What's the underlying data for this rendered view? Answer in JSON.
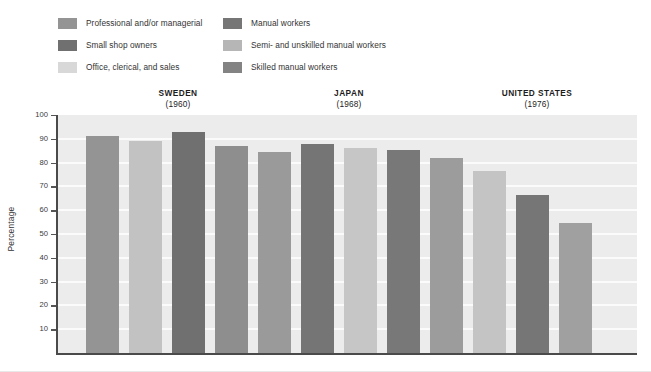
{
  "chart_data": {
    "type": "bar",
    "title": "",
    "xlabel": "",
    "ylabel": "Percentage",
    "ylim": [
      0,
      100
    ],
    "ytick_values": [
      10,
      20,
      30,
      40,
      50,
      60,
      70,
      80,
      90,
      100
    ],
    "ytick_labels": [
      "10",
      "20",
      "30",
      "40",
      "50",
      "60",
      "70",
      "80",
      "90",
      "100"
    ],
    "grid": true,
    "legend_position": "top-left",
    "legend": [
      {
        "label": "Professional and/or managerial",
        "color": "#949494"
      },
      {
        "label": "Small shop owners",
        "color": "#707070"
      },
      {
        "label": "Office, clerical, and sales",
        "color": "#d8d8d8"
      },
      {
        "label": "Manual workers",
        "color": "#767676"
      },
      {
        "label": "Semi- and unskilled manual workers",
        "color": "#b6b6b6"
      },
      {
        "label": "Skilled manual workers",
        "color": "#838383"
      }
    ],
    "groups": [
      {
        "name": "SWEDEN",
        "year": "(1960)",
        "bars": [
          {
            "category": "Professional and/or managerial",
            "value": 91,
            "color": "#949494"
          },
          {
            "category": "Office, clerical, and sales",
            "value": 89,
            "color": "#c2c2c2"
          },
          {
            "category": "Small shop owners",
            "value": 93,
            "color": "#707070"
          },
          {
            "category": "Skilled manual workers",
            "value": 87,
            "color": "#8e8e8e"
          }
        ]
      },
      {
        "name": "JAPAN",
        "year": "(1968)",
        "bars": [
          {
            "category": "Professional and/or managerial",
            "value": 84.5,
            "color": "#9a9a9a"
          },
          {
            "category": "Small shop owners",
            "value": 88,
            "color": "#757575"
          },
          {
            "category": "Office, clerical, and sales",
            "value": 86,
            "color": "#c6c6c6"
          },
          {
            "category": "Manual workers",
            "value": 85.5,
            "color": "#787878"
          }
        ]
      },
      {
        "name": "UNITED STATES",
        "year": "(1976)",
        "bars": [
          {
            "category": "Professional and/or managerial",
            "value": 82,
            "color": "#9c9c9c"
          },
          {
            "category": "Semi- and unskilled manual workers",
            "value": 76.5,
            "color": "#c4c4c4"
          },
          {
            "category": "Skilled manual workers",
            "value": 66.5,
            "color": "#767676"
          },
          {
            "category": "Manual workers",
            "value": 54.5,
            "color": "#a0a0a0"
          }
        ]
      }
    ]
  },
  "colors": {
    "plot_background": "#ececec",
    "gridline": "#fbfbfb",
    "axis": "#4a4a4a",
    "text": "#333333"
  }
}
